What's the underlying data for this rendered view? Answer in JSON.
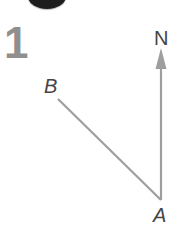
{
  "page": {
    "background_color": "#ffffff"
  },
  "question": {
    "number": "1",
    "number_color": "#8f8f8f"
  },
  "partial_object_top": {
    "color": "#1d1d1d"
  },
  "diagram": {
    "type": "bearing-diagram",
    "line_color": "#9e9e9e",
    "label_color": "#454545",
    "labels": {
      "north": "N",
      "point_a": "A",
      "point_b": "B"
    },
    "points": {
      "A": {
        "x": 161,
        "y": 200
      },
      "B": {
        "x": 58,
        "y": 99
      }
    },
    "north_arrow": {
      "from": {
        "x": 161,
        "y": 200
      },
      "tip": {
        "x": 161,
        "y": 48
      },
      "head_width": 11,
      "head_length": 21
    }
  }
}
